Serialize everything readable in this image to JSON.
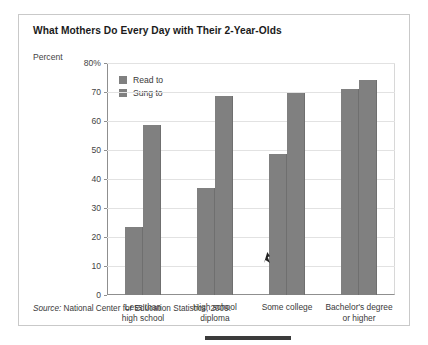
{
  "figure": {
    "title": "What Mothers Do Every Day with Their 2-Year-Olds",
    "percent_axis_label": "Percent",
    "source_prefix": "Source:",
    "source_text": "National Center for Education Statistics, 2009."
  },
  "legend": {
    "items": [
      {
        "label": "Read to",
        "color": "#808080"
      },
      {
        "label": "Sung to",
        "color": "#808080"
      }
    ]
  },
  "chart_data": {
    "type": "bar",
    "title": "What Mothers Do Every Day with Their 2-Year-Olds",
    "xlabel": "",
    "ylabel": "Percent",
    "ylim": [
      0,
      80
    ],
    "yticks": [
      0,
      10,
      20,
      30,
      40,
      50,
      60,
      70,
      80
    ],
    "ytick_labels": [
      "0",
      "10",
      "20",
      "30",
      "40",
      "50",
      "60",
      "70",
      "80%"
    ],
    "grid": true,
    "legend_position": "upper-left-inside",
    "categories": [
      "Less than high school",
      "High school diploma",
      "Some college",
      "Bachelor's degree or higher"
    ],
    "category_lines": [
      [
        "Less than",
        "high school"
      ],
      [
        "High school",
        "diploma"
      ],
      [
        "Some college",
        ""
      ],
      [
        "Bachelor's degree",
        "or higher"
      ]
    ],
    "series": [
      {
        "name": "Read to",
        "color": "#808080",
        "values": [
          23.5,
          37,
          48.5,
          71
        ]
      },
      {
        "name": "Sung to",
        "color": "#808080",
        "values": [
          58.5,
          68.5,
          69.5,
          74
        ]
      }
    ]
  },
  "marks": {
    "cursor": "cursor-arrow",
    "bottom_rule": "page-rule"
  }
}
